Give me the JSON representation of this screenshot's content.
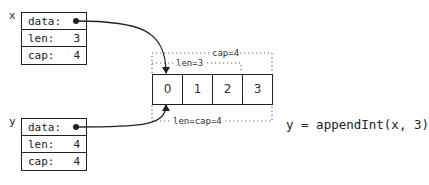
{
  "headers": [
    {
      "var": "x",
      "fields": [
        {
          "label": "data:",
          "value": "•"
        },
        {
          "label": "len:",
          "value": "3"
        },
        {
          "label": "cap:",
          "value": "4"
        }
      ]
    },
    {
      "var": "y",
      "fields": [
        {
          "label": "data:",
          "value": "•"
        },
        {
          "label": "len:",
          "value": "4"
        },
        {
          "label": "cap:",
          "value": "4"
        }
      ]
    }
  ],
  "array": {
    "cells": [
      "0",
      "1",
      "2",
      "3"
    ]
  },
  "annotations": {
    "cap_top": "cap=4",
    "len_x": "len=3",
    "len_cap_y": "len=cap=4"
  },
  "code": "y = appendInt(x, 3)",
  "colors": {
    "line": "#222222",
    "dotted": "#555555"
  }
}
